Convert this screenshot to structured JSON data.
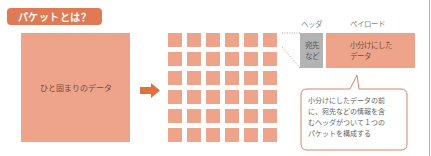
{
  "title": "パケットとは？",
  "big_block": {
    "label": "ひと固まりのデータ"
  },
  "arrow": {
    "icon": "right-arrow-icon"
  },
  "grid": {
    "rows": 6,
    "cols": 6
  },
  "packet": {
    "header_label": "ヘッダ",
    "payload_label": "ペイロード",
    "header_box_lines": [
      "宛先",
      "など"
    ],
    "payload_box_lines": [
      "小分けにした",
      "データ"
    ]
  },
  "callout": {
    "lines": [
      "小分けにしたデータの前",
      "に、宛先などの情報を含",
      "むヘッダがついて１つの",
      "パケットを構成する"
    ]
  },
  "colors": {
    "accent": "#e07a55",
    "data_block": "#eea48a",
    "header_gray": "#b3b3b3",
    "arrow": "#e07040",
    "callout_border": "#d9826a"
  }
}
